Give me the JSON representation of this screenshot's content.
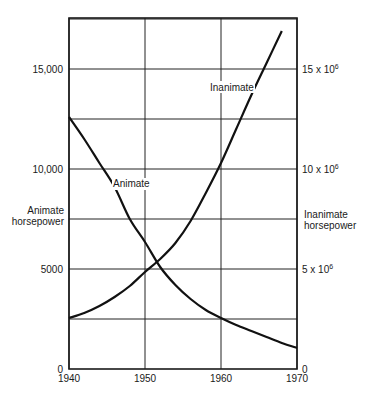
{
  "chart_data": {
    "type": "line",
    "title": "",
    "xlabel": "",
    "x_ticks": [
      "1940",
      "1950",
      "1960",
      "1970"
    ],
    "xlim": [
      1940,
      1970
    ],
    "left_axis": {
      "label_line1": "Animate",
      "label_line2": "horsepower",
      "ticks": [
        "0",
        "5000",
        "10,000",
        "15,000"
      ],
      "tick_values": [
        0,
        5000,
        10000,
        15000
      ],
      "ylim": [
        0,
        17550
      ]
    },
    "right_axis": {
      "label_line1": "Inanimate",
      "label_line2": "horsepower",
      "ticks": [
        {
          "value": 0,
          "base": "0",
          "exp": ""
        },
        {
          "value": 5000000,
          "base": "5 x 10",
          "exp": "6"
        },
        {
          "value": 10000000,
          "base": "10 x 10",
          "exp": "6"
        },
        {
          "value": 15000000,
          "base": "15 x 10",
          "exp": "6"
        }
      ],
      "ylim": [
        0,
        17550000
      ]
    },
    "grid": true,
    "legend": "none (inline curve labels)",
    "series": [
      {
        "name": "Animate",
        "axis": "left",
        "x": [
          1940,
          1942,
          1944,
          1946,
          1948,
          1950,
          1952,
          1954,
          1956,
          1958,
          1960,
          1962,
          1964,
          1966,
          1968,
          1970
        ],
        "values": [
          12600,
          11500,
          10300,
          9100,
          7500,
          6350,
          5100,
          4200,
          3500,
          2950,
          2550,
          2200,
          1900,
          1600,
          1300,
          1050
        ]
      },
      {
        "name": "Inanimate",
        "axis": "right",
        "x": [
          1940,
          1942,
          1944,
          1946,
          1948,
          1950,
          1952,
          1954,
          1956,
          1958,
          1960,
          1962,
          1964,
          1966,
          1968
        ],
        "values": [
          2550000,
          2800000,
          3150000,
          3600000,
          4150000,
          4850000,
          5500000,
          6300000,
          7400000,
          8800000,
          10300000,
          12000000,
          13700000,
          15300000,
          16900000
        ]
      }
    ],
    "annotations": [
      {
        "text": "Animate",
        "near_series": "Animate"
      },
      {
        "text": "Inanimate",
        "near_series": "Inanimate"
      }
    ],
    "colors": {
      "line": "#111111",
      "grid": "#222222",
      "background": "#ffffff"
    }
  }
}
